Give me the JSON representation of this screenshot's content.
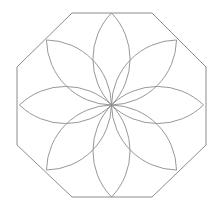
{
  "diagram": {
    "type": "geometric-rosette",
    "petal_count": 8,
    "colors": {
      "background": "#ffffff",
      "stroke": "#8c8c8c"
    }
  }
}
